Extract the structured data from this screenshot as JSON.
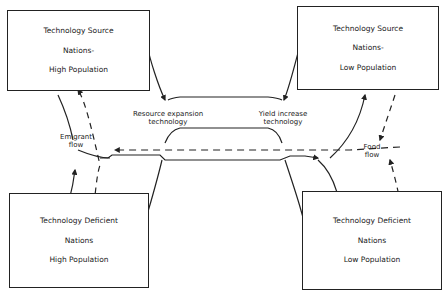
{
  "boxes": {
    "top_left": {
      "line1": "Technology Source",
      "line2": "Nations-",
      "line3": "High Population"
    },
    "top_right": {
      "line1": "Technology Source",
      "line2": "Nations-",
      "line3": "Low Population"
    },
    "bottom_left": {
      "line1": "Technology Deficient",
      "line2": "Nations",
      "line3": "High Population"
    },
    "bottom_right": {
      "line1": "Technology Deficient",
      "line2": "Nations",
      "line3": "Low Population"
    }
  },
  "labels": {
    "resource_1": "Resource expansion",
    "resource_2": "technology",
    "yield_1": "Yield increase",
    "yield_2": "technology",
    "emigrant_1": "Emigrant",
    "emigrant_2": "flow",
    "food_1": "Food",
    "food_2": "flow"
  },
  "colors": {
    "line": "#222222",
    "background": "#ffffff"
  }
}
